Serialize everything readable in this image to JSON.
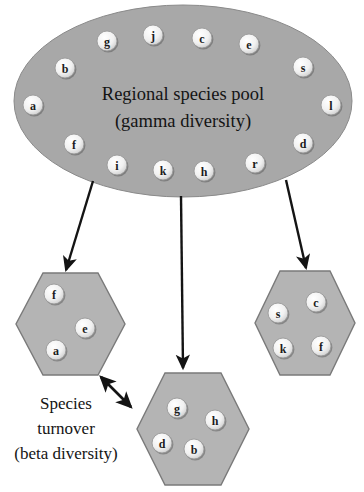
{
  "figure": {
    "background_color": "#ffffff",
    "shape_fill": "#a8a8a8",
    "hexagon_fill": "#b4b4b4",
    "circle_fill": "#f0f0f0",
    "stroke_color": "#6e6e6e",
    "arrow_color": "#141414",
    "text_color": "#141414"
  },
  "regional_pool": {
    "title_line1": "Regional species pool",
    "title_line2": "(gamma diversity)",
    "species": [
      {
        "label": "g",
        "cx": 107,
        "cy": 41
      },
      {
        "label": "j",
        "cx": 153,
        "cy": 35
      },
      {
        "label": "c",
        "cx": 202,
        "cy": 38
      },
      {
        "label": "e",
        "cx": 249,
        "cy": 44
      },
      {
        "label": "b",
        "cx": 65,
        "cy": 68
      },
      {
        "label": "s",
        "cx": 303,
        "cy": 67
      },
      {
        "label": "a",
        "cx": 33,
        "cy": 105
      },
      {
        "label": "l",
        "cx": 331,
        "cy": 105
      },
      {
        "label": "f",
        "cx": 74,
        "cy": 144
      },
      {
        "label": "d",
        "cx": 303,
        "cy": 143
      },
      {
        "label": "i",
        "cx": 117,
        "cy": 165
      },
      {
        "label": "k",
        "cx": 163,
        "cy": 170
      },
      {
        "label": "h",
        "cx": 204,
        "cy": 171
      },
      {
        "label": "r",
        "cx": 255,
        "cy": 163
      }
    ]
  },
  "local_communities": [
    {
      "name": "left-community",
      "species": [
        {
          "label": "f",
          "cx": 54,
          "cy": 294
        },
        {
          "label": "e",
          "cx": 85,
          "cy": 328
        },
        {
          "label": "a",
          "cx": 56,
          "cy": 350
        }
      ]
    },
    {
      "name": "middle-community",
      "species": [
        {
          "label": "g",
          "cx": 177,
          "cy": 408
        },
        {
          "label": "h",
          "cx": 215,
          "cy": 420
        },
        {
          "label": "d",
          "cx": 162,
          "cy": 443
        },
        {
          "label": "b",
          "cx": 194,
          "cy": 449
        }
      ]
    },
    {
      "name": "right-community",
      "species": [
        {
          "label": "s",
          "cx": 278,
          "cy": 313
        },
        {
          "label": "c",
          "cx": 316,
          "cy": 302
        },
        {
          "label": "k",
          "cx": 283,
          "cy": 348
        },
        {
          "label": "f",
          "cx": 321,
          "cy": 346
        }
      ]
    }
  ],
  "turnover_annotation": {
    "line1": "Species",
    "line2": "turnover",
    "line3": "(beta diversity)"
  }
}
